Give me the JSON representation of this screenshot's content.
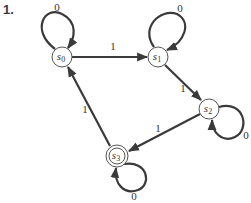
{
  "problem": {
    "number": "1."
  },
  "diagram": {
    "type": "finite-state-machine",
    "states": [
      {
        "id": "s0",
        "name": "s",
        "sub": "0",
        "start": false,
        "accepting": false
      },
      {
        "id": "s1",
        "name": "s",
        "sub": "1",
        "start": false,
        "accepting": false
      },
      {
        "id": "s2",
        "name": "s",
        "sub": "2",
        "start": false,
        "accepting": false
      },
      {
        "id": "s3",
        "name": "s",
        "sub": "3",
        "start": false,
        "accepting": true
      }
    ],
    "transitions": [
      {
        "from": "s0",
        "to": "s0",
        "label": "0"
      },
      {
        "from": "s0",
        "to": "s1",
        "label": "1"
      },
      {
        "from": "s1",
        "to": "s1",
        "label": "0"
      },
      {
        "from": "s1",
        "to": "s2",
        "label": "1"
      },
      {
        "from": "s2",
        "to": "s2",
        "label": "0"
      },
      {
        "from": "s2",
        "to": "s3",
        "label": "1"
      },
      {
        "from": "s3",
        "to": "s3",
        "label": "0"
      },
      {
        "from": "s3",
        "to": "s0",
        "label": "1"
      }
    ]
  }
}
